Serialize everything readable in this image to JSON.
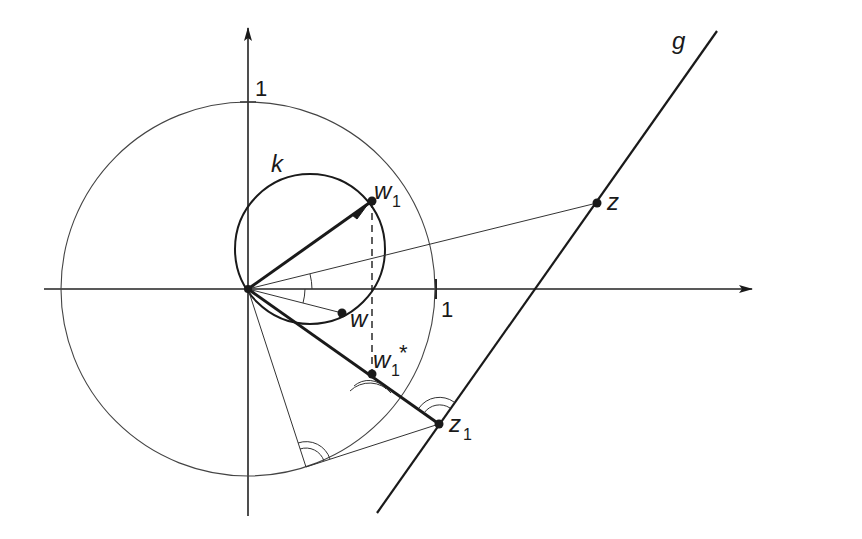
{
  "figure": {
    "type": "geometric-diagram",
    "colors": {
      "background": "#ffffff",
      "ink": "#1a1a1a",
      "thin_line": "#333333"
    },
    "labels": {
      "y_axis_tick": "1",
      "x_axis_tick": "1",
      "circle_k": "k",
      "line_g": "g",
      "point_z": "z",
      "point_w": "w",
      "point_w1": "w",
      "point_w1_sub": "1",
      "point_w1_star": "w",
      "point_w1_star_sub": "1",
      "point_w1_star_sup": "*",
      "point_z1": "z",
      "point_z1_sub": "1"
    },
    "elements": {
      "axes": [
        "x-axis (arrow right)",
        "y-axis (arrow up)"
      ],
      "unit_circle": "circle of radius 1 centered at origin",
      "circle_k": "small circle through origin, w and w1",
      "line_g": "straight line through z and z1",
      "segments": [
        "O→w1 (arrow, bold)",
        "O→z (thin)",
        "O→w (thin)",
        "O→z1 (bold through w1*)",
        "O→tangent point (thin)",
        "tangent point→z1 (thin)",
        "w1→w1* (dashed vertical)"
      ],
      "right_angle_marks": [
        "at w1*",
        "at z1",
        "at tangent point"
      ],
      "angle_arcs": [
        "between O→z and x-axis",
        "between x-axis and O→w"
      ]
    }
  }
}
